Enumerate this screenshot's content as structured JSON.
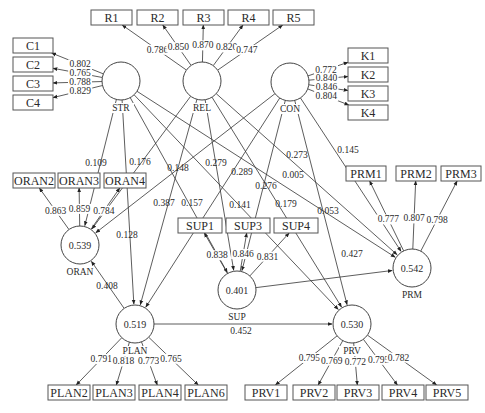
{
  "latent_variables": [
    {
      "id": "STR",
      "label": "STR",
      "r2": "",
      "cx": 121,
      "cy": 81
    },
    {
      "id": "REL",
      "label": "REL",
      "r2": "",
      "cx": 202,
      "cy": 81
    },
    {
      "id": "CON",
      "label": "CON",
      "r2": "",
      "cx": 290,
      "cy": 82
    },
    {
      "id": "ORAN",
      "label": "ORAN",
      "r2": "0.539",
      "cx": 80,
      "cy": 245
    },
    {
      "id": "SUP",
      "label": "SUP",
      "r2": "0.401",
      "cx": 237,
      "cy": 290
    },
    {
      "id": "PLAN",
      "label": "PLAN",
      "r2": "0.519",
      "cx": 135,
      "cy": 324
    },
    {
      "id": "PRM",
      "label": "PRM",
      "r2": "0.542",
      "cx": 412,
      "cy": 268
    },
    {
      "id": "PRV",
      "label": "PRV",
      "r2": "0.530",
      "cx": 352,
      "cy": 324
    }
  ],
  "indicators": [
    {
      "label": "C1",
      "x": 13,
      "y": 38,
      "w": 40,
      "lv": "STR",
      "loading": "0.802"
    },
    {
      "label": "C2",
      "x": 13,
      "y": 57,
      "w": 40,
      "lv": "STR",
      "loading": "0.765"
    },
    {
      "label": "C3",
      "x": 13,
      "y": 76,
      "w": 40,
      "lv": "STR",
      "loading": "0.788"
    },
    {
      "label": "C4",
      "x": 13,
      "y": 95,
      "w": 40,
      "lv": "STR",
      "loading": "0.829"
    },
    {
      "label": "R1",
      "x": 91,
      "y": 10,
      "w": 41,
      "lv": "REL",
      "loading": "0.786"
    },
    {
      "label": "R2",
      "x": 137,
      "y": 10,
      "w": 41,
      "lv": "REL",
      "loading": "0.850"
    },
    {
      "label": "R3",
      "x": 183,
      "y": 10,
      "w": 41,
      "lv": "REL",
      "loading": "0.870"
    },
    {
      "label": "R4",
      "x": 228,
      "y": 10,
      "w": 41,
      "lv": "REL",
      "loading": "0.820"
    },
    {
      "label": "R5",
      "x": 273,
      "y": 10,
      "w": 41,
      "lv": "REL",
      "loading": "0.747"
    },
    {
      "label": "K1",
      "x": 348,
      "y": 48,
      "w": 40,
      "lv": "CON",
      "loading": "0.772"
    },
    {
      "label": "K2",
      "x": 348,
      "y": 67,
      "w": 40,
      "lv": "CON",
      "loading": "0.840"
    },
    {
      "label": "K3",
      "x": 348,
      "y": 86,
      "w": 40,
      "lv": "CON",
      "loading": "0.846"
    },
    {
      "label": "K4",
      "x": 348,
      "y": 105,
      "w": 40,
      "lv": "CON",
      "loading": "0.804"
    },
    {
      "label": "ORAN2",
      "x": 13,
      "y": 173,
      "w": 42,
      "lv": "ORAN",
      "loading": "0.863"
    },
    {
      "label": "ORAN3",
      "x": 58,
      "y": 173,
      "w": 42,
      "lv": "ORAN",
      "loading": "0.859"
    },
    {
      "label": "ORAN4",
      "x": 104,
      "y": 173,
      "w": 42,
      "lv": "ORAN",
      "loading": "0.784"
    },
    {
      "label": "SUP1",
      "x": 178,
      "y": 218,
      "w": 44,
      "lv": "SUP",
      "loading": "0.838"
    },
    {
      "label": "SUP3",
      "x": 226,
      "y": 218,
      "w": 44,
      "lv": "SUP",
      "loading": "0.846"
    },
    {
      "label": "SUP4",
      "x": 274,
      "y": 218,
      "w": 44,
      "lv": "SUP",
      "loading": "0.831"
    },
    {
      "label": "PRM1",
      "x": 346,
      "y": 166,
      "w": 40,
      "lv": "PRM",
      "loading": "0.777"
    },
    {
      "label": "PRM2",
      "x": 396,
      "y": 166,
      "w": 40,
      "lv": "PRM",
      "loading": "0.807"
    },
    {
      "label": "PRM3",
      "x": 441,
      "y": 166,
      "w": 40,
      "lv": "PRM",
      "loading": "0.798"
    },
    {
      "label": "PLAN2",
      "x": 48,
      "y": 385,
      "w": 42,
      "lv": "PLAN",
      "loading": "0.791"
    },
    {
      "label": "PLAN3",
      "x": 93,
      "y": 385,
      "w": 42,
      "lv": "PLAN",
      "loading": "0.818"
    },
    {
      "label": "PLAN4",
      "x": 139,
      "y": 385,
      "w": 42,
      "lv": "PLAN",
      "loading": "0.773"
    },
    {
      "label": "PLAN6",
      "x": 185,
      "y": 385,
      "w": 42,
      "lv": "PLAN",
      "loading": "0.765"
    },
    {
      "label": "PRV1",
      "x": 245,
      "y": 385,
      "w": 42,
      "lv": "PRV",
      "loading": "0.795"
    },
    {
      "label": "PRV2",
      "x": 293,
      "y": 385,
      "w": 42,
      "lv": "PRV",
      "loading": "0.769"
    },
    {
      "label": "PRV3",
      "x": 337,
      "y": 385,
      "w": 42,
      "lv": "PRV",
      "loading": "0.772"
    },
    {
      "label": "PRV4",
      "x": 382,
      "y": 385,
      "w": 42,
      "lv": "PRV",
      "loading": "0.795"
    },
    {
      "label": "PRV5",
      "x": 426,
      "y": 385,
      "w": 42,
      "lv": "PRV",
      "loading": "0.782"
    }
  ],
  "paths": [
    {
      "from": "STR",
      "to": "ORAN",
      "coef": "0.109",
      "lx": 96,
      "ly": 163
    },
    {
      "from": "STR",
      "to": "PLAN",
      "coef": "0.128",
      "lx": 127,
      "ly": 235
    },
    {
      "from": "STR",
      "to": "SUP",
      "coef": "0.157",
      "lx": 192,
      "ly": 203
    },
    {
      "from": "STR",
      "to": "PRM",
      "coef": "0.005",
      "lx": 293,
      "ly": 175
    },
    {
      "from": "STR",
      "to": "PRV",
      "coef": "0.141",
      "lx": 240,
      "ly": 205
    },
    {
      "from": "REL",
      "to": "ORAN",
      "coef": "0.176",
      "lx": 140,
      "ly": 162
    },
    {
      "from": "REL",
      "to": "PLAN",
      "coef": "0.387",
      "lx": 164,
      "ly": 203
    },
    {
      "from": "REL",
      "to": "SUP",
      "coef": "0.279",
      "lx": 216,
      "ly": 163
    },
    {
      "from": "REL",
      "to": "PRM",
      "coef": "0.273",
      "lx": 297,
      "ly": 155
    },
    {
      "from": "REL",
      "to": "PRV",
      "coef": "0.276",
      "lx": 266,
      "ly": 186
    },
    {
      "from": "CON",
      "to": "ORAN",
      "coef": "0.148",
      "lx": 178,
      "ly": 168
    },
    {
      "from": "CON",
      "to": "PLAN",
      "coef": "0.289",
      "lx": 242,
      "ly": 172
    },
    {
      "from": "CON",
      "to": "SUP",
      "coef": "0.179",
      "lx": 286,
      "ly": 204
    },
    {
      "from": "CON",
      "to": "PRM",
      "coef": "0.145",
      "lx": 348,
      "ly": 150
    },
    {
      "from": "CON",
      "to": "PRV",
      "coef": "0.053",
      "lx": 328,
      "ly": 211
    },
    {
      "from": "PLAN",
      "to": "ORAN",
      "coef": "0.408",
      "lx": 107,
      "ly": 286
    },
    {
      "from": "SUP",
      "to": "PRM",
      "coef": "0.427",
      "lx": 352,
      "ly": 254
    },
    {
      "from": "PLAN",
      "to": "PRV",
      "coef": "0.452",
      "lx": 241,
      "ly": 331
    },
    {
      "from": "SUP",
      "to": "PLAN",
      "coef": "",
      "lx": 0,
      "ly": 0
    }
  ],
  "colors": {
    "stroke": "#333333",
    "text": "#2a2a2a",
    "background": "#ffffff"
  }
}
